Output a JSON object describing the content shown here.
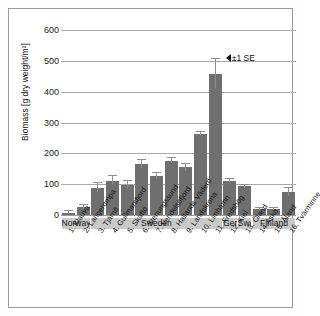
{
  "chart_data": {
    "type": "bar",
    "title": "",
    "xlabel": "",
    "ylabel": "Biomass [g dry weight/m²]",
    "ylim": [
      0,
      600
    ],
    "yticks": [
      0,
      100,
      200,
      300,
      400,
      500,
      600
    ],
    "ytick_labels": [
      "0",
      "100",
      "200",
      "300",
      "400",
      "500",
      "600"
    ],
    "grid": true,
    "legend": "none",
    "annotation": "±1 SE",
    "annotation_marker": "left-triangle",
    "error_bars": "±1 SE",
    "bar_color": "#6f6f6f",
    "error_color": "#8e8e8e",
    "grid_color": "#a8a8a8",
    "band_color": "#c9c9c9",
    "categories": [
      "1. Klauva",
      "2. Langerompa",
      "3. Tjärnö",
      "4. Gullmarsfjord",
      "5. Skaftö",
      "6. Stenungssund",
      "7. Vendelsöfjord",
      "8. Hallands Väderö",
      "9. Landskrona",
      "10. Limhamn",
      "11. Fredshög",
      "12. Kiel",
      "13. Öland",
      "14.Askö",
      "15. Åland",
      "16. Tvärminne"
    ],
    "values": [
      10,
      30,
      92,
      115,
      100,
      168,
      130,
      180,
      158,
      265,
      462,
      113,
      97,
      22,
      22,
      78
    ],
    "errors": [
      5,
      6,
      15,
      16,
      14,
      13,
      11,
      8,
      12,
      7,
      46,
      7,
      5,
      4,
      4,
      14
    ],
    "groups": [
      {
        "label": "Norway",
        "start": 0,
        "end": 1
      },
      {
        "label": "Sweden",
        "start": 2,
        "end": 10
      },
      {
        "label": "Ger.",
        "start": 11,
        "end": 11
      },
      {
        "label": "Swed.",
        "start": 12,
        "end": 12
      },
      {
        "label": "Finland",
        "start": 13,
        "end": 15
      }
    ]
  }
}
